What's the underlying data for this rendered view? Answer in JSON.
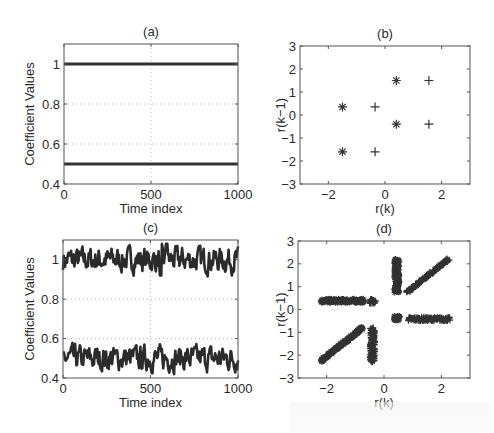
{
  "chart_data": [
    {
      "id": "a",
      "type": "line",
      "title": "(a)",
      "xlabel": "Time index",
      "ylabel": "Coefficient Values",
      "xlim": [
        0,
        1000
      ],
      "ylim": [
        0.4,
        1.1
      ],
      "xticks": [
        0,
        500,
        1000
      ],
      "yticks": [
        0.4,
        0.6,
        0.8,
        1
      ],
      "ytick_labels": [
        "0.4",
        "0.6",
        "0.8",
        "1"
      ],
      "grid": true,
      "series": [
        {
          "name": "coefficient 1",
          "x": [
            0,
            1000
          ],
          "values": [
            1.0,
            1.0
          ]
        },
        {
          "name": "coefficient 2",
          "x": [
            0,
            1000
          ],
          "values": [
            0.5,
            0.5
          ]
        }
      ]
    },
    {
      "id": "b",
      "type": "scatter",
      "title": "(b)",
      "xlabel": "r(k)",
      "ylabel": "r(k−1)",
      "xlim": [
        -3,
        3
      ],
      "ylim": [
        -3,
        3
      ],
      "xticks": [
        -2,
        0,
        2
      ],
      "xtick_labels": [
        "−2",
        "0",
        "2"
      ],
      "yticks": [
        -3,
        -2,
        -1,
        0,
        1,
        2,
        3
      ],
      "ytick_labels": [
        "−3",
        "−2",
        "−1",
        "0",
        "1",
        "2",
        "3"
      ],
      "grid": false,
      "series": [
        {
          "name": "class star",
          "marker": "*",
          "points": [
            [
              -1.5,
              0.35
            ],
            [
              0.4,
              1.5
            ],
            [
              0.4,
              -0.4
            ],
            [
              -1.5,
              -1.6
            ]
          ]
        },
        {
          "name": "class plus",
          "marker": "+",
          "points": [
            [
              -0.35,
              0.35
            ],
            [
              1.55,
              1.5
            ],
            [
              1.55,
              -0.4
            ],
            [
              -0.35,
              -1.6
            ]
          ]
        }
      ]
    },
    {
      "id": "c",
      "type": "line",
      "title": "(c)",
      "xlabel": "Time index",
      "ylabel": "Coefficient Values",
      "xlim": [
        0,
        1000
      ],
      "ylim": [
        0.4,
        1.1
      ],
      "xticks": [
        0,
        500,
        1000
      ],
      "yticks": [
        0.4,
        0.6,
        0.8,
        1
      ],
      "ytick_labels": [
        "0.4",
        "0.6",
        "0.8",
        "1"
      ],
      "grid": true,
      "series": [
        {
          "name": "estimated coefficient 1 (noisy, mean ~1.0, range ~0.9-1.08, spike ~1.08 near t=590, dip ~0.92 near t=560)",
          "mean": 1.0,
          "spread": 0.04
        },
        {
          "name": "estimated coefficient 2 (noisy, mean ~0.5, range ~0.4-0.58)",
          "mean": 0.5,
          "spread": 0.04
        }
      ]
    },
    {
      "id": "d",
      "type": "scatter",
      "title": "(d)",
      "xlabel": "r(k)",
      "ylabel": "r(k−1)",
      "xlim": [
        -3,
        3
      ],
      "ylim": [
        -3,
        3
      ],
      "xticks": [
        -2,
        0,
        2
      ],
      "xtick_labels": [
        "−2",
        "0",
        "2"
      ],
      "yticks": [
        -3,
        -2,
        -1,
        0,
        1,
        2,
        3
      ],
      "ytick_labels": [
        "−3",
        "−2",
        "−1",
        "0",
        "1",
        "2",
        "3"
      ],
      "grid": false,
      "clusters": [
        {
          "marker": "*",
          "shape": "horizontal bar",
          "from": [
            -2.2,
            0.38
          ],
          "to": [
            -0.7,
            0.38
          ]
        },
        {
          "marker": "+",
          "shape": "blob",
          "center": [
            -0.4,
            0.35
          ]
        },
        {
          "marker": "*",
          "shape": "vertical bar",
          "from": [
            0.45,
            0.75
          ],
          "to": [
            0.45,
            2.2
          ]
        },
        {
          "marker": "+",
          "shape": "diagonal bar",
          "from": [
            0.8,
            0.75
          ],
          "to": [
            2.25,
            2.2
          ]
        },
        {
          "marker": "*",
          "shape": "blob",
          "center": [
            0.45,
            -0.38
          ]
        },
        {
          "marker": "+",
          "shape": "horizontal bar",
          "from": [
            0.85,
            -0.42
          ],
          "to": [
            2.3,
            -0.42
          ]
        },
        {
          "marker": "*",
          "shape": "diagonal bar",
          "from": [
            -2.2,
            -2.25
          ],
          "to": [
            -0.75,
            -0.8
          ]
        },
        {
          "marker": "+",
          "shape": "vertical bar",
          "from": [
            -0.4,
            -0.8
          ],
          "to": [
            -0.4,
            -2.3
          ]
        }
      ]
    }
  ]
}
